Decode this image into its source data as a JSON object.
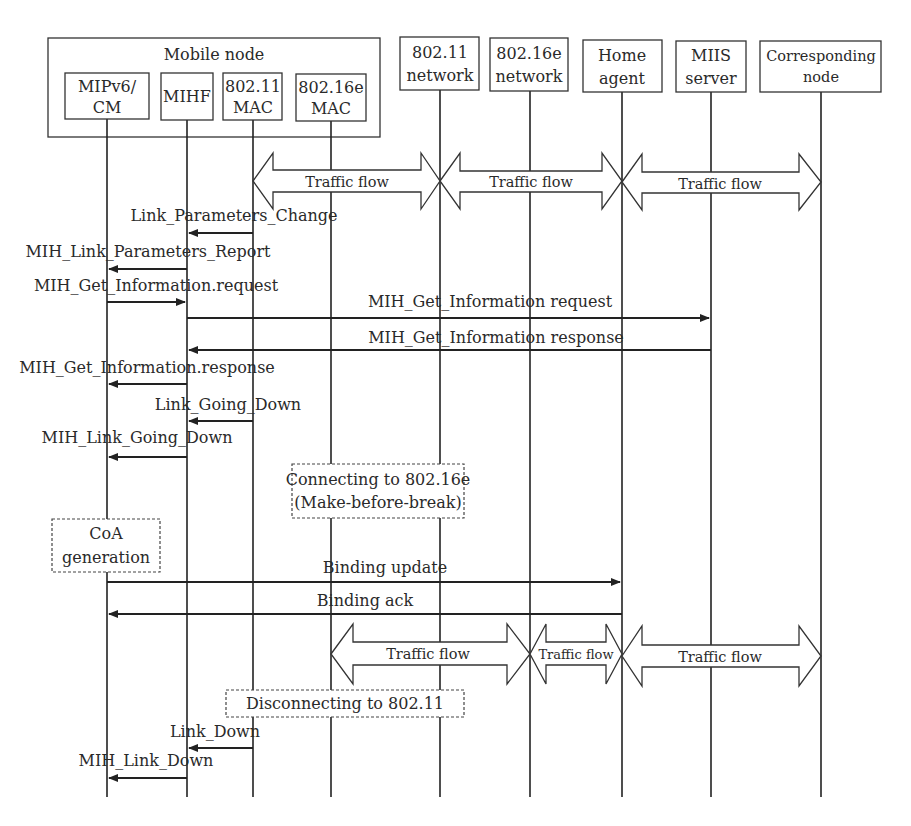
{
  "diagram": {
    "type": "sequence",
    "group": {
      "title": "Mobile node"
    },
    "participants": [
      {
        "id": "mipv6",
        "line1": "MIPv6/",
        "line2": "CM",
        "x": 107
      },
      {
        "id": "mihf",
        "line1": "MIHF",
        "line2": "",
        "x": 187
      },
      {
        "id": "mac80211",
        "line1": "802.11",
        "line2": "MAC",
        "x": 253
      },
      {
        "id": "mac80216e",
        "line1": "802.16e",
        "line2": "MAC",
        "x": 331
      },
      {
        "id": "net80211",
        "line1": "802.11",
        "line2": "network",
        "x": 440
      },
      {
        "id": "net80216e",
        "line1": "802.16e",
        "line2": "network",
        "x": 530
      },
      {
        "id": "home_agent",
        "line1": "Home",
        "line2": "agent",
        "x": 622
      },
      {
        "id": "miis",
        "line1": "MIIS",
        "line2": "server",
        "x": 711
      },
      {
        "id": "cn",
        "line1": "Corresponding",
        "line2": "node",
        "x": 821
      }
    ],
    "traffic_flows_top": [
      {
        "label": "Traffic flow",
        "from": "mac80211",
        "to": "net80211"
      },
      {
        "label": "Traffic flow",
        "from": "net80211",
        "to": "home_agent"
      },
      {
        "label": "Traffic flow",
        "from": "home_agent",
        "to": "cn"
      }
    ],
    "messages": [
      {
        "label": "Link_Parameters_Change",
        "from": "mac80211",
        "to": "mihf"
      },
      {
        "label": "MIH_Link_Parameters_Report",
        "from": "mihf",
        "to": "mipv6"
      },
      {
        "label": "MIH_Get_Information.request",
        "from": "mipv6",
        "to": "mihf"
      },
      {
        "label": "MIH_Get_Information request",
        "from": "mihf",
        "to": "miis"
      },
      {
        "label": "MIH_Get_Information response",
        "from": "miis",
        "to": "mihf"
      },
      {
        "label": "MIH_Get_Information.response",
        "from": "mihf",
        "to": "mipv6"
      },
      {
        "label": "Link_Going_Down",
        "from": "mac80211",
        "to": "mihf"
      },
      {
        "label": "MIH_Link_Going_Down",
        "from": "mihf",
        "to": "mipv6"
      },
      {
        "label": "Binding update",
        "from": "mipv6",
        "to": "home_agent"
      },
      {
        "label": "Binding ack",
        "from": "home_agent",
        "to": "mipv6"
      },
      {
        "label": "Link_Down",
        "from": "mac80211",
        "to": "mihf"
      },
      {
        "label": "MIH_Link_Down",
        "from": "mihf",
        "to": "mipv6"
      }
    ],
    "notes": {
      "connecting_line1": "Connecting to 802.16e",
      "connecting_line2": "(Make-before-break)",
      "coa_line1": "CoA",
      "coa_line2": "generation",
      "disconnecting": "Disconnecting to 802.11"
    },
    "traffic_flows_bottom": [
      {
        "label": "Traffic flow",
        "from": "mac80216e",
        "to": "net80216e"
      },
      {
        "label": "Traffic flow",
        "from": "net80216e",
        "to": "home_agent"
      },
      {
        "label": "Traffic flow",
        "from": "home_agent",
        "to": "cn"
      }
    ]
  }
}
